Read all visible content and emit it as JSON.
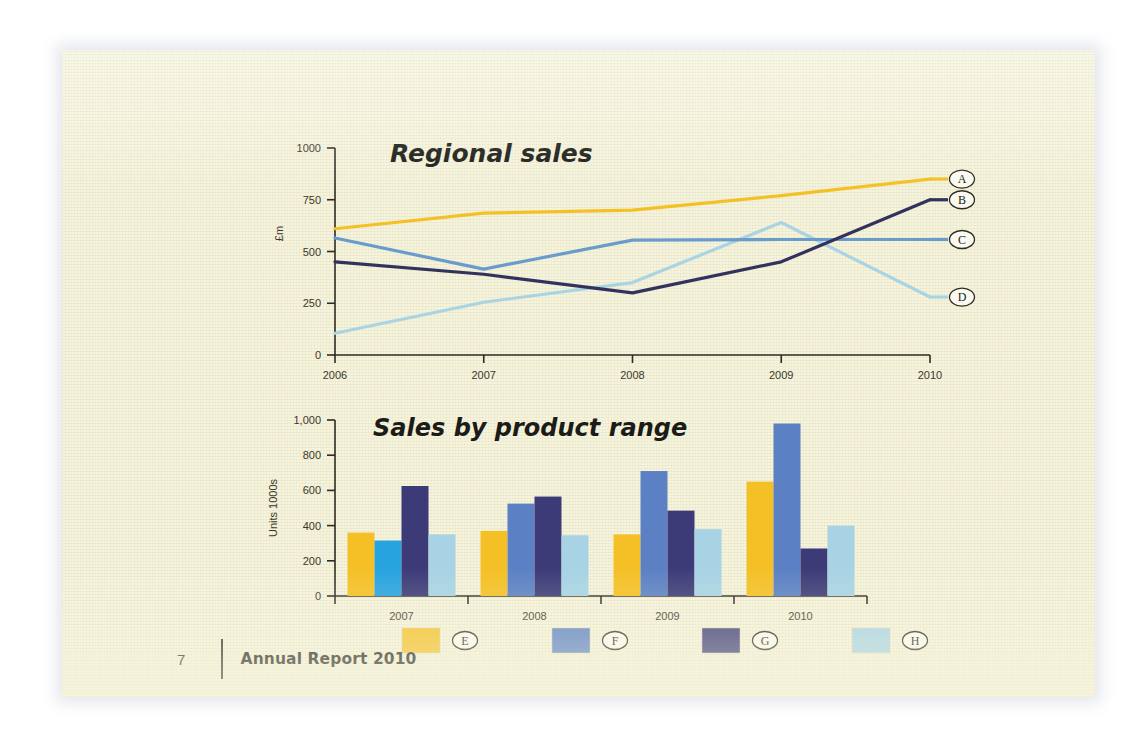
{
  "document": {
    "page_number": "7",
    "footer_title": "Annual Report 2010",
    "page_background": "#f6f4dc"
  },
  "palette": {
    "gold": "#f4c026",
    "steel_blue": "#5b81c4",
    "cyan_blue": "#27a3e0",
    "navy": "#3c3b78",
    "pale_blue": "#a7d3e4",
    "line_light_blue": "#a9d4e3",
    "line_mid_blue": "#6a9bcd",
    "line_navy": "#32325e",
    "ink": "#1b1b17"
  },
  "chart_data": [
    {
      "type": "line",
      "title": "Regional sales",
      "xlabel": "",
      "ylabel": "£m",
      "x": [
        "2006",
        "2007",
        "2008",
        "2009",
        "2010"
      ],
      "xticklabels": [
        "2006",
        "2007",
        "2008",
        "2009",
        "2010"
      ],
      "yticklabels": [
        "0",
        "250",
        "500",
        "750",
        "1000"
      ],
      "yticks": [
        0,
        250,
        500,
        750,
        1000
      ],
      "ylim": [
        0,
        1000
      ],
      "grid": false,
      "legend_position": "right-end-of-line",
      "series": [
        {
          "name": "A",
          "color": "#f4c026",
          "values": [
            610,
            685,
            700,
            770,
            850
          ]
        },
        {
          "name": "B",
          "color": "#32325e",
          "values": [
            450,
            390,
            300,
            450,
            750
          ]
        },
        {
          "name": "C",
          "color": "#6a9bcd",
          "values": [
            565,
            415,
            555,
            558,
            558
          ]
        },
        {
          "name": "D",
          "color": "#a9d4e3",
          "values": [
            105,
            255,
            350,
            640,
            280
          ]
        }
      ]
    },
    {
      "type": "bar",
      "title": "Sales by product range",
      "xlabel": "",
      "ylabel": "Units 1000s",
      "categories": [
        "2007",
        "2008",
        "2009",
        "2010"
      ],
      "yticklabels": [
        "0",
        "200",
        "400",
        "600",
        "800",
        "1,000"
      ],
      "yticks": [
        0,
        200,
        400,
        600,
        800,
        1000
      ],
      "ylim": [
        0,
        1000
      ],
      "grid": false,
      "legend_position": "bottom",
      "series": [
        {
          "name": "E",
          "color": "#f4c026",
          "values": [
            360,
            370,
            350,
            650
          ]
        },
        {
          "name": "F",
          "color": "#5b81c4",
          "values": [
            315,
            525,
            710,
            980
          ]
        },
        {
          "name": "G",
          "color": "#3c3b78",
          "values": [
            625,
            565,
            485,
            270
          ]
        },
        {
          "name": "H",
          "color": "#a7d3e4",
          "values": [
            350,
            345,
            380,
            400
          ]
        }
      ],
      "series_color_overrides": [
        {
          "series": "F",
          "category": "2007",
          "color": "#27a3e0"
        }
      ],
      "legend": [
        {
          "label": "E",
          "color": "#f4c026"
        },
        {
          "label": "F",
          "color": "#5b81c4"
        },
        {
          "label": "G",
          "color": "#3c3b78"
        },
        {
          "label": "H",
          "color": "#a7d3e4"
        }
      ]
    }
  ]
}
